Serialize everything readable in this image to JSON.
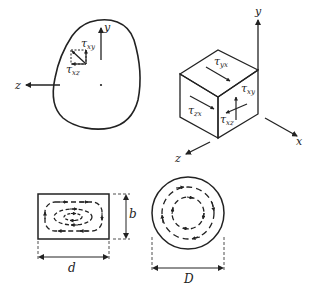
{
  "figure": {
    "colors": {
      "stroke": "#222222",
      "background": "#ffffff"
    },
    "body_section": {
      "axis_labels": {
        "y": "y",
        "z": "z"
      },
      "stress_labels": {
        "tau_xy": "τ",
        "tau_xy_sub": "xy",
        "tau_xz": "τ",
        "tau_xz_sub": "xz"
      }
    },
    "cube_element": {
      "axis_labels": {
        "x": "x",
        "y": "y",
        "z": "z"
      },
      "stress_labels": {
        "tau_yx": "τ",
        "tau_yx_sub": "yx",
        "tau_zx": "τ",
        "tau_zx_sub": "zx",
        "tau_xy": "τ",
        "tau_xy_sub": "xy",
        "tau_xz": "τ",
        "tau_xz_sub": "xz"
      }
    },
    "rectangular_section": {
      "dimension_width": "d",
      "dimension_height": "b"
    },
    "circular_section": {
      "dimension_diameter": "D"
    }
  }
}
